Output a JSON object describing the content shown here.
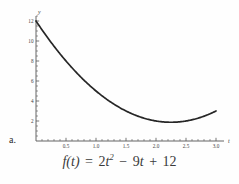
{
  "item": {
    "label": "a."
  },
  "equation": {
    "lhs": "f(t)",
    "equals": "=",
    "term1_coeff": "2",
    "term1_var": "t",
    "term1_exp": "2",
    "minus": "−",
    "term2_coeff": "9",
    "term2_var": "t",
    "plus": "+",
    "constant": "12",
    "full": "f(t) = 2t² − 9t + 12"
  },
  "chart_data": {
    "type": "line",
    "title": "",
    "xlabel": "t",
    "ylabel": "y",
    "function": "f(t) = 2t^2 - 9t + 12",
    "coefficients": {
      "a": 2,
      "b": -9,
      "c": 12
    },
    "xlim": [
      0,
      3.05
    ],
    "ylim": [
      0,
      12.6
    ],
    "xticks": [
      0.5,
      1.0,
      1.5,
      2.0,
      2.5,
      3.0
    ],
    "xticklabels": [
      "0.5",
      "1.0",
      "1.5",
      "2.0",
      "2.5",
      "3.0"
    ],
    "yticks": [
      2,
      4,
      6,
      8,
      10,
      12
    ],
    "yticklabels": [
      "2",
      "4",
      "6",
      "8",
      "10",
      "12"
    ],
    "minor_xtick_step": 0.1,
    "minor_ytick_step": 0.5,
    "grid": false,
    "legend": false,
    "line_color": "#262626",
    "axis_color": "#555555",
    "vertex": {
      "t": 2.25,
      "y": 1.875
    },
    "x": [
      0,
      0.15,
      0.3,
      0.45,
      0.6,
      0.75,
      0.9,
      1.05,
      1.2,
      1.35,
      1.5,
      1.65,
      1.8,
      1.95,
      2.1,
      2.25,
      2.4,
      2.55,
      2.7,
      2.85,
      3.0
    ],
    "y": [
      12,
      10.695,
      9.48,
      8.355,
      7.32,
      6.375,
      5.52,
      4.755,
      4.08,
      3.495,
      3,
      2.595,
      2.28,
      2.055,
      1.92,
      1.875,
      1.92,
      2.055,
      2.28,
      2.595,
      3
    ]
  }
}
